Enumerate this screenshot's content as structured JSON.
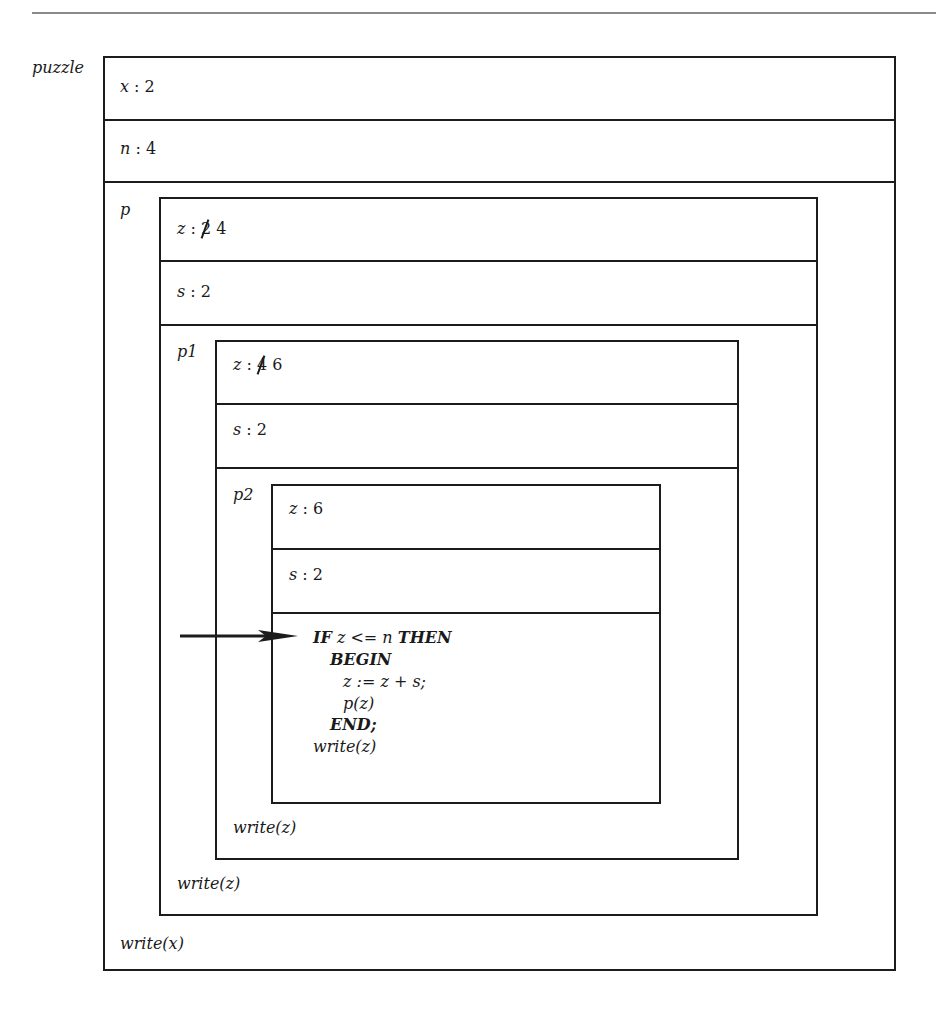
{
  "diagram": {
    "type": "nested-scope-stack-diagram",
    "outer": {
      "label": "puzzle",
      "vars": [
        {
          "name": "x",
          "sep": " : ",
          "value": "2"
        },
        {
          "name": "n",
          "sep": " : ",
          "value": "4"
        }
      ],
      "trailer": "write(x)"
    },
    "p": {
      "label": "p",
      "vars": [
        {
          "name": "z",
          "sep": " : ",
          "struck": "2",
          "value": " 4"
        },
        {
          "name": "s",
          "sep": " : ",
          "value": "2"
        }
      ],
      "trailer": "write(z)"
    },
    "p1": {
      "label": "p1",
      "vars": [
        {
          "name": "z",
          "sep": " : ",
          "struck": "4",
          "value": " 6"
        },
        {
          "name": "s",
          "sep": " : ",
          "value": "2"
        }
      ],
      "trailer": "write(z)"
    },
    "p2": {
      "label": "p2",
      "vars": [
        {
          "name": "z",
          "sep": " : ",
          "value": "6"
        },
        {
          "name": "s",
          "sep": " : ",
          "value": "2"
        }
      ],
      "code": {
        "line1_kw1": "IF",
        "line1_mid": " z <= n ",
        "line1_kw2": "THEN",
        "line2": "BEGIN",
        "line3": "z := z + s;",
        "line4": "p(z)",
        "line5": "END;",
        "line6": "write(z)"
      }
    },
    "pointer": "current-execution-arrow"
  }
}
